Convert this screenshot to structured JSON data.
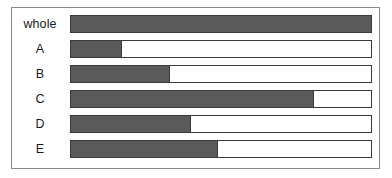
{
  "chart_data": {
    "type": "bar",
    "title": "",
    "subtitle": "",
    "xlabel": "",
    "ylabel": "",
    "orientation": "horizontal",
    "grid": false,
    "legend": null,
    "axis_ticks": [],
    "xlim": [
      0,
      100
    ],
    "units": "percent of whole",
    "categories": [
      "whole",
      "A",
      "B",
      "C",
      "D",
      "E"
    ],
    "values": [
      100,
      17,
      33,
      81,
      40,
      49
    ],
    "series": [
      {
        "name": "proportion filled",
        "values": [
          100,
          17,
          33,
          81,
          40,
          49
        ]
      }
    ],
    "bars": [
      {
        "label": "whole",
        "value": 100,
        "fill_percent": 100
      },
      {
        "label": "A",
        "value": 17,
        "fill_percent": 17
      },
      {
        "label": "B",
        "value": 33,
        "fill_percent": 33
      },
      {
        "label": "C",
        "value": 81,
        "fill_percent": 81
      },
      {
        "label": "D",
        "value": 40,
        "fill_percent": 40
      },
      {
        "label": "E",
        "value": 49,
        "fill_percent": 49
      }
    ],
    "colors": {
      "fill": "#5a5a5a",
      "track": "#ffffff",
      "bar_outline": "#3a3a3a",
      "frame_outline": "#8a8a8a",
      "background": "#ffffff",
      "label_text": "#1a1a1a"
    }
  }
}
